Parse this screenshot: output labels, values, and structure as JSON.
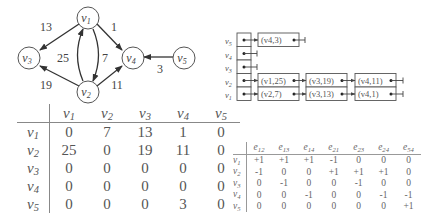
{
  "graph": {
    "nodes": [
      {
        "id": "v1",
        "label": "v",
        "sub": "1"
      },
      {
        "id": "v2",
        "label": "v",
        "sub": "2"
      },
      {
        "id": "v3",
        "label": "v",
        "sub": "3"
      },
      {
        "id": "v4",
        "label": "v",
        "sub": "4"
      },
      {
        "id": "v5",
        "label": "v",
        "sub": "5"
      }
    ],
    "edges": [
      {
        "from": "v1",
        "to": "v3",
        "weight": "13"
      },
      {
        "from": "v1",
        "to": "v4",
        "weight": "1"
      },
      {
        "from": "v1",
        "to": "v2",
        "weight": "7"
      },
      {
        "from": "v2",
        "to": "v1",
        "weight": "25"
      },
      {
        "from": "v2",
        "to": "v3",
        "weight": "19"
      },
      {
        "from": "v2",
        "to": "v4",
        "weight": "11"
      },
      {
        "from": "v5",
        "to": "v4",
        "weight": "3"
      }
    ]
  },
  "adjacency_matrix": {
    "columns": [
      "v1",
      "v2",
      "v3",
      "v4",
      "v5"
    ],
    "rows": [
      {
        "label": "v1",
        "values": [
          "0",
          "7",
          "13",
          "1",
          "0"
        ]
      },
      {
        "label": "v2",
        "values": [
          "25",
          "0",
          "19",
          "11",
          "0"
        ]
      },
      {
        "label": "v3",
        "values": [
          "0",
          "0",
          "0",
          "0",
          "0"
        ]
      },
      {
        "label": "v4",
        "values": [
          "0",
          "0",
          "0",
          "0",
          "0"
        ]
      },
      {
        "label": "v5",
        "values": [
          "0",
          "0",
          "0",
          "3",
          "0"
        ]
      }
    ]
  },
  "adjacency_list": {
    "heads": [
      "v5",
      "v4",
      "v3",
      "v2",
      "v1"
    ],
    "lists": {
      "v5": [
        "(v4,3)"
      ],
      "v4": [],
      "v3": [],
      "v2": [
        "(v1,25)",
        "(v3,19)",
        "(v4,11)"
      ],
      "v1": [
        "(v2,7)",
        "(v3,13)",
        "(v4,1)"
      ]
    }
  },
  "incidence_matrix": {
    "columns": [
      "e12",
      "e13",
      "e14",
      "e21",
      "e23",
      "e24",
      "e54"
    ],
    "rows": [
      {
        "label": "v1",
        "values": [
          "+1",
          "+1",
          "+1",
          "-1",
          "0",
          "0",
          "0"
        ]
      },
      {
        "label": "v2",
        "values": [
          "-1",
          "0",
          "0",
          "+1",
          "+1",
          "+1",
          "0"
        ]
      },
      {
        "label": "v3",
        "values": [
          "0",
          "-1",
          "0",
          "0",
          "-1",
          "0",
          "0"
        ]
      },
      {
        "label": "v4",
        "values": [
          "0",
          "0",
          "-1",
          "0",
          "0",
          "-1",
          "-1"
        ]
      },
      {
        "label": "v5",
        "values": [
          "0",
          "0",
          "0",
          "0",
          "0",
          "0",
          "+1"
        ]
      }
    ]
  }
}
